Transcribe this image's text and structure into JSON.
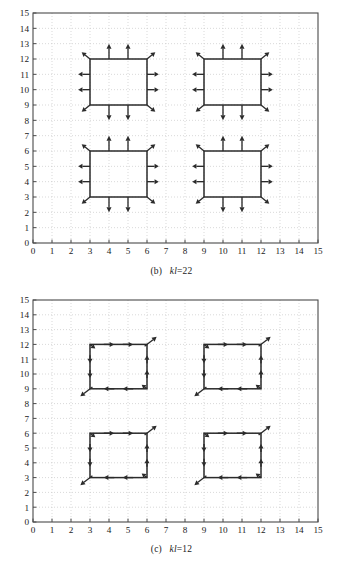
{
  "figure": {
    "type": "vector-field-diagram",
    "background": "#ffffff",
    "line_color": "#2b2b2b",
    "grid_color": "#c9c9c9",
    "axis_color": "#4a4a4a"
  },
  "panels": [
    {
      "id": "b",
      "caption_prefix": "(b)",
      "caption_var": "kl",
      "caption_value": "=22",
      "caption_full": "(b) kl=22",
      "pattern": "outward-normal",
      "chart_data": {
        "type": "scatter",
        "title": "(b) kl=22",
        "xlabel": "",
        "ylabel": "",
        "xlim": [
          0,
          15
        ],
        "ylim": [
          0,
          15
        ],
        "xticks": [
          0,
          1,
          2,
          3,
          4,
          5,
          6,
          7,
          8,
          9,
          10,
          11,
          12,
          13,
          14,
          15
        ],
        "yticks": [
          0,
          1,
          2,
          3,
          4,
          5,
          6,
          7,
          8,
          9,
          10,
          11,
          12,
          13,
          14,
          15
        ],
        "grid": true,
        "legend": "none",
        "squares": [
          {
            "x0": 3,
            "y0": 9,
            "x1": 6,
            "y1": 12
          },
          {
            "x0": 9,
            "y0": 9,
            "x1": 12,
            "y1": 12
          },
          {
            "x0": 3,
            "y0": 3,
            "x1": 6,
            "y1": 6
          },
          {
            "x0": 9,
            "y0": 3,
            "x1": 12,
            "y1": 6
          }
        ],
        "arrow_rule": "outward normals: two arrows per edge at 1/3 and 2/3 positions, plus diagonal arrows at the four corners",
        "edge_arrow_fracs": [
          0.3333,
          0.6667
        ],
        "arrow_len_edge": 1.0,
        "arrow_len_corner": 0.62
      }
    },
    {
      "id": "c",
      "caption_prefix": "(c)",
      "caption_var": "kl",
      "caption_value": "=12",
      "caption_full": "(c) kl=12",
      "pattern": "counterclockwise-circulation",
      "chart_data": {
        "type": "scatter",
        "title": "(c) kl=12",
        "xlabel": "",
        "ylabel": "",
        "xlim": [
          0,
          15
        ],
        "ylim": [
          0,
          15
        ],
        "xticks": [
          0,
          1,
          2,
          3,
          4,
          5,
          6,
          7,
          8,
          9,
          10,
          11,
          12,
          13,
          14,
          15
        ],
        "yticks": [
          0,
          1,
          2,
          3,
          4,
          5,
          6,
          7,
          8,
          9,
          10,
          11,
          12,
          13,
          14,
          15
        ],
        "grid": true,
        "legend": "none",
        "squares": [
          {
            "x0": 3,
            "y0": 9,
            "x1": 6,
            "y1": 12
          },
          {
            "x0": 9,
            "y0": 9,
            "x1": 12,
            "y1": 12
          },
          {
            "x0": 3,
            "y0": 3,
            "x1": 6,
            "y1": 6
          },
          {
            "x0": 9,
            "y0": 3,
            "x1": 12,
            "y1": 6
          }
        ],
        "arrow_rule": "tangential arrows along each edge following the loop direction, plus diagonal arrows at top-right (up-right) and bottom-left (down-left) corners",
        "loop_direction": "top edge +x, right edge -y, bottom edge -x, left edge -y-to-down then up on left",
        "edge_arrow_fracs": [
          0.3333,
          0.6667
        ],
        "arrow_len_edge": 0.55,
        "arrow_len_corner": 0.72
      }
    }
  ],
  "axis_labels": {
    "x": [
      "0",
      "1",
      "2",
      "3",
      "4",
      "5",
      "6",
      "7",
      "8",
      "9",
      "10",
      "11",
      "12",
      "13",
      "14",
      "15"
    ],
    "y": [
      "0",
      "1",
      "2",
      "3",
      "4",
      "5",
      "6",
      "7",
      "8",
      "9",
      "10",
      "11",
      "12",
      "13",
      "14",
      "15"
    ]
  }
}
